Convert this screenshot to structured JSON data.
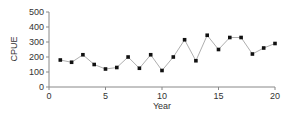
{
  "chart_data": {
    "type": "line",
    "title": "",
    "xlabel": "Year",
    "ylabel": "CPUE",
    "xlim": [
      0,
      20
    ],
    "ylim": [
      0,
      500
    ],
    "xticks": [
      0,
      5,
      10,
      15,
      20
    ],
    "yticks": [
      0,
      100,
      200,
      300,
      400,
      500
    ],
    "grid": false,
    "legend": null,
    "series": [
      {
        "name": "CPUE",
        "marker": "square",
        "line_color": "#999999",
        "marker_color": "#111111",
        "x": [
          1,
          2,
          3,
          4,
          5,
          6,
          7,
          8,
          9,
          10,
          11,
          12,
          13,
          14,
          15,
          16,
          17,
          18,
          19,
          20
        ],
        "values": [
          180,
          165,
          215,
          150,
          120,
          130,
          200,
          125,
          215,
          110,
          200,
          315,
          175,
          345,
          250,
          330,
          330,
          220,
          260,
          290
        ]
      }
    ]
  }
}
